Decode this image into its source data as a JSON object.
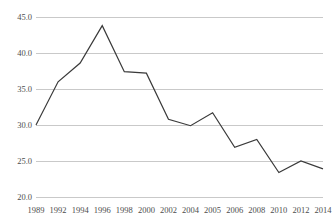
{
  "chart_data": {
    "type": "line",
    "title": "",
    "xlabel": "",
    "ylabel": "",
    "categories": [
      "1989",
      "1992",
      "1994",
      "1996",
      "1998",
      "2000",
      "2002",
      "2004",
      "2005",
      "2006",
      "2008",
      "2010",
      "2012",
      "2014"
    ],
    "values": [
      30.0,
      36.0,
      38.6,
      43.8,
      37.4,
      37.2,
      30.8,
      29.9,
      31.7,
      26.9,
      28.0,
      23.4,
      25.0,
      23.9
    ],
    "ylim": [
      20.0,
      45.0
    ],
    "ytick_labels": [
      "45.0",
      "40.0",
      "35.0",
      "30.0",
      "25.0",
      "20.0"
    ],
    "ytick_values": [
      45.0,
      40.0,
      35.0,
      30.0,
      25.0,
      20.0
    ],
    "grid": true,
    "legend": "none",
    "line_color": "#3a3a3a",
    "grid_color": "#c9c9c9"
  }
}
